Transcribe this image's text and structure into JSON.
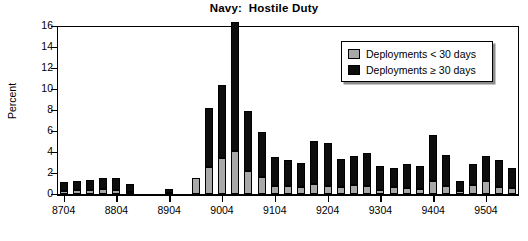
{
  "chart_data": {
    "type": "bar",
    "title": "Navy:  Hostile Duty",
    "subtitle": "",
    "xlabel": "",
    "ylabel": "Percent",
    "ylim": [
      0,
      16
    ],
    "yticks": [
      0,
      2,
      4,
      6,
      8,
      10,
      12,
      14,
      16
    ],
    "ytick_labels": [
      "0",
      "2",
      "4",
      "6",
      "8",
      "10",
      "12",
      "14",
      "16"
    ],
    "grid": false,
    "stacked": true,
    "legend_position": "top-right",
    "legend": [
      {
        "name": "Deployments < 30 days",
        "color": "#a8a8a8"
      },
      {
        "name": "Deployments ≥ 30 days",
        "color": "#0d0d0d"
      }
    ],
    "xtick_labels": [
      "8704",
      "8804",
      "8904",
      "9004",
      "9104",
      "9204",
      "9304",
      "9404",
      "9504"
    ],
    "xtick_categories": [
      "8704",
      "8804",
      "8904",
      "9004",
      "9104",
      "9204",
      "9304",
      "9404",
      "9504"
    ],
    "categories": [
      "8704",
      "8707",
      "8710",
      "8801",
      "8804",
      "8807",
      "8810",
      "8901",
      "8904",
      "8907",
      "8910",
      "9001",
      "9004",
      "9007",
      "9010",
      "9101",
      "9104",
      "9107",
      "9110",
      "9201",
      "9204",
      "9207",
      "9210",
      "9301",
      "9304",
      "9307",
      "9310",
      "9401",
      "9404",
      "9407",
      "9410",
      "9501",
      "9504",
      "9507",
      "9510"
    ],
    "series": [
      {
        "name": "Deployments < 30 days",
        "color": "#a8a8a8",
        "values": [
          0.3,
          0.35,
          0.4,
          0.45,
          0.35,
          0.15,
          0.0,
          0.0,
          0.05,
          0.0,
          1.55,
          2.6,
          3.45,
          4.1,
          2.2,
          1.6,
          0.75,
          0.75,
          0.7,
          1.0,
          0.8,
          0.7,
          0.85,
          0.75,
          0.4,
          0.65,
          0.6,
          0.5,
          1.25,
          0.75,
          0.25,
          0.85,
          1.2,
          0.7,
          0.6
        ]
      },
      {
        "name": "Deployments ≥ 30 days",
        "color": "#0d0d0d",
        "values": [
          0.8,
          0.9,
          0.9,
          1.1,
          1.2,
          0.85,
          0.0,
          0.0,
          0.4,
          0.0,
          0.0,
          5.55,
          6.9,
          12.3,
          5.7,
          4.3,
          2.8,
          2.5,
          2.3,
          4.05,
          4.05,
          2.65,
          2.8,
          3.2,
          2.25,
          1.8,
          2.3,
          2.15,
          4.4,
          2.95,
          0.95,
          2.05,
          2.45,
          2.55,
          1.9
        ]
      }
    ],
    "totals": [
      1.1,
      1.25,
      1.3,
      1.55,
      1.55,
      1.0,
      0.0,
      0.0,
      0.45,
      0.0,
      1.55,
      8.15,
      10.35,
      16.4,
      7.9,
      5.9,
      3.55,
      3.25,
      3.0,
      5.05,
      4.85,
      3.35,
      3.65,
      3.95,
      2.65,
      2.45,
      2.9,
      2.65,
      5.65,
      3.7,
      1.2,
      2.9,
      3.65,
      3.25,
      2.5
    ]
  }
}
